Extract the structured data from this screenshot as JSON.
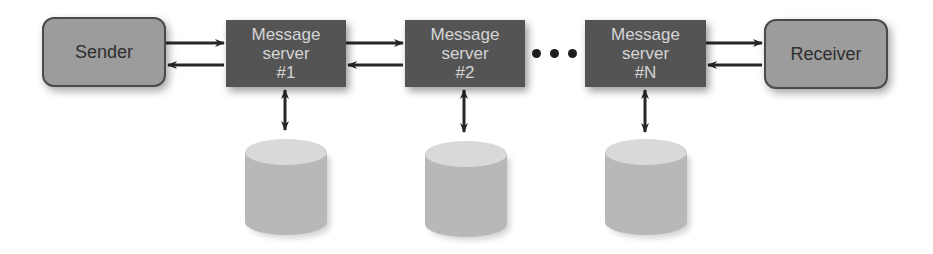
{
  "diagram": {
    "sender": {
      "label": "Sender"
    },
    "receiver": {
      "label": "Receiver"
    },
    "servers": [
      {
        "line1": "Message",
        "line2": "server",
        "line3": "#1"
      },
      {
        "line1": "Message",
        "line2": "server",
        "line3": "#2"
      },
      {
        "line1": "Message",
        "line2": "server",
        "line3": "#N"
      }
    ],
    "ellipsis": "...",
    "storage_count": 3,
    "colors": {
      "endpoint_fill": "#9c9c9c",
      "server_fill": "#545454",
      "server_text": "#d4d4d4",
      "arrow": "#262626",
      "cylinder_body": "#b8b8b8",
      "cylinder_top": "#d9d9d9"
    }
  }
}
